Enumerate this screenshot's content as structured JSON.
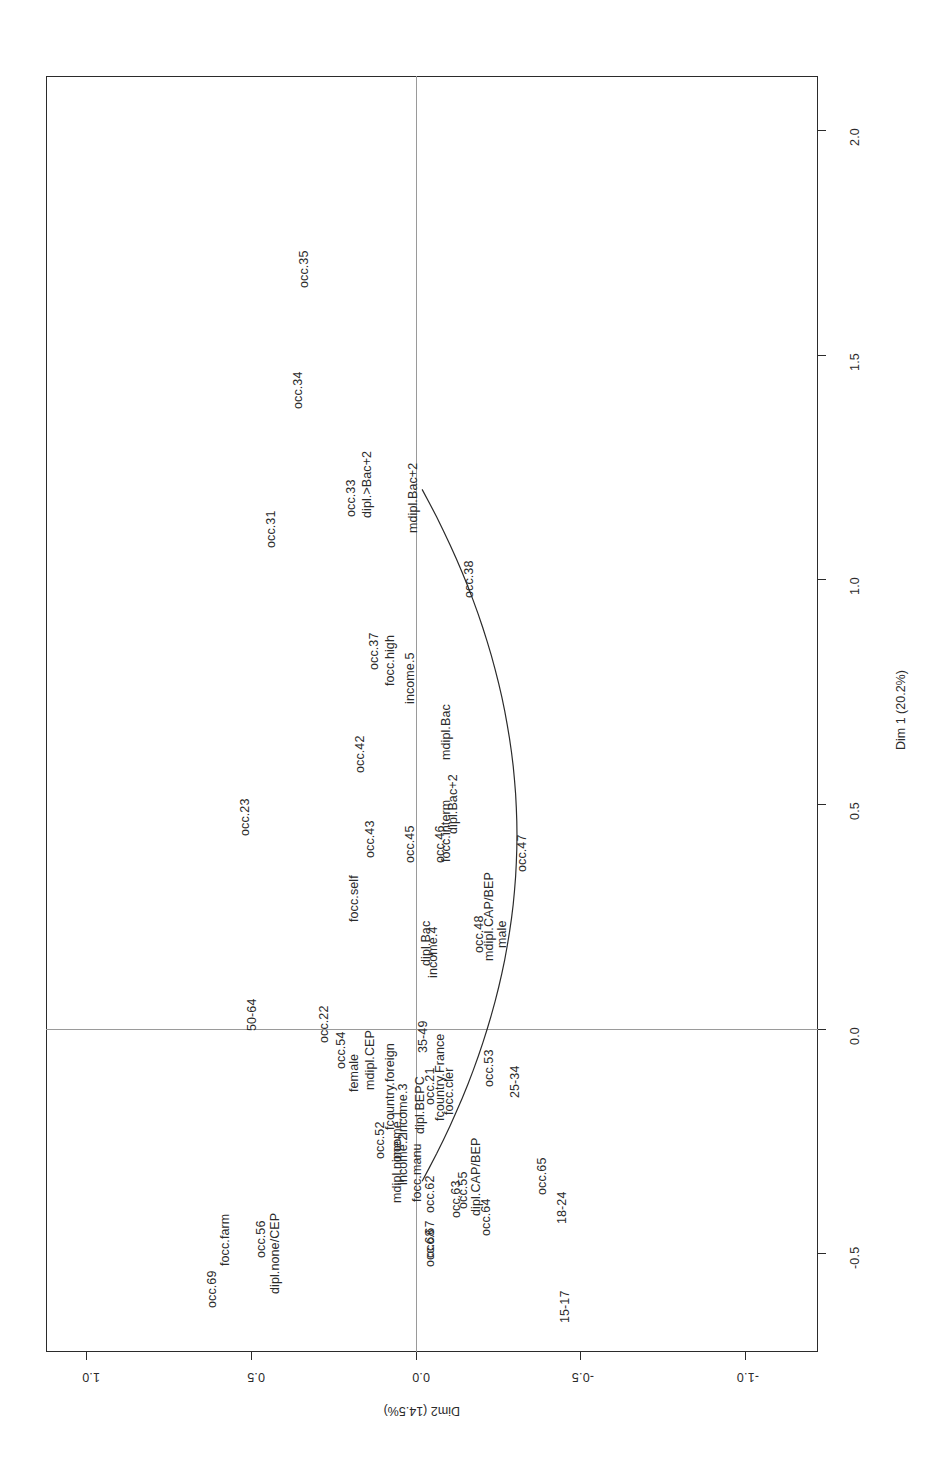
{
  "figure": {
    "orientation": "rotated-90",
    "background": "#ffffff",
    "frame_color": "#2b2b2b",
    "zero_line_color": "#9a9a9a",
    "text_color": "#2b2b2b"
  },
  "chart_data": {
    "type": "scatter",
    "title": "",
    "subtitle": "",
    "xlabel": "Dim 1 (20.2%)",
    "ylabel": "Dim2 (14.5%)",
    "xlim": [
      -0.72,
      2.12
    ],
    "ylim": [
      -1.22,
      1.12
    ],
    "xticks": [
      0.5,
      1.0,
      1.5,
      2.0
    ],
    "xticklabels": [
      "0.5",
      "1.0",
      "1.5",
      "2.0"
    ],
    "extra_xticks": [
      0.0,
      -0.5
    ],
    "extra_xticklabels": [
      "0.0",
      "-0.5"
    ],
    "yticks": [
      1.0,
      0.5,
      0.0,
      -0.5,
      -1.0
    ],
    "yticklabels": [
      "1.0",
      "0.5",
      "0.0",
      "-0.5",
      "-1.0"
    ],
    "grid": false,
    "legend": null,
    "zero_lines": [
      {
        "axis": "x",
        "value": 0.0
      },
      {
        "axis": "y",
        "value": 0.0
      }
    ],
    "annotations": [
      {
        "kind": "curve",
        "description": "horseshoe-arc"
      }
    ],
    "points": [
      {
        "label": "occ.69",
        "x": -0.58,
        "y": 0.62
      },
      {
        "label": "focc.farm",
        "x": -0.47,
        "y": 0.58
      },
      {
        "label": "dipl.none/CEP",
        "x": -0.5,
        "y": 0.43
      },
      {
        "label": "occ.56",
        "x": -0.47,
        "y": 0.47
      },
      {
        "label": "15-17",
        "x": -0.62,
        "y": -0.45
      },
      {
        "label": "18-24",
        "x": -0.4,
        "y": -0.44
      },
      {
        "label": "occ.65",
        "x": -0.33,
        "y": -0.38
      },
      {
        "label": "occ.64",
        "x": -0.42,
        "y": -0.21
      },
      {
        "label": "occ.63",
        "x": -0.38,
        "y": -0.12
      },
      {
        "label": "occ.62",
        "x": -0.37,
        "y": -0.04
      },
      {
        "label": "occ.67",
        "x": -0.47,
        "y": -0.04
      },
      {
        "label": "occ.68",
        "x": -0.49,
        "y": -0.04
      },
      {
        "label": "occ.55",
        "x": -0.36,
        "y": -0.14
      },
      {
        "label": "dipl.CAP/BEP",
        "x": -0.33,
        "y": -0.18
      },
      {
        "label": "focc.manu",
        "x": -0.32,
        "y": 0.0
      },
      {
        "label": "mdipl.none",
        "x": -0.32,
        "y": 0.06
      },
      {
        "label": "income.2",
        "x": -0.29,
        "y": 0.04
      },
      {
        "label": "income.1",
        "x": -0.24,
        "y": 0.06
      },
      {
        "label": "occ.52",
        "x": -0.25,
        "y": 0.11
      },
      {
        "label": "income.3",
        "x": -0.18,
        "y": 0.04
      },
      {
        "label": "dipl.BEPC",
        "x": -0.17,
        "y": -0.01
      },
      {
        "label": "occ.21",
        "x": -0.13,
        "y": -0.04
      },
      {
        "label": "fcountry.France",
        "x": -0.11,
        "y": -0.07
      },
      {
        "label": "focc.cler",
        "x": -0.14,
        "y": -0.1
      },
      {
        "label": "fcountry.foreign",
        "x": -0.13,
        "y": 0.08
      },
      {
        "label": "female",
        "x": -0.1,
        "y": 0.19
      },
      {
        "label": "occ.54",
        "x": -0.05,
        "y": 0.23
      },
      {
        "label": "mdipl.CEP",
        "x": -0.07,
        "y": 0.14
      },
      {
        "label": "occ.22",
        "x": 0.01,
        "y": 0.28
      },
      {
        "label": "50-64",
        "x": 0.03,
        "y": 0.5
      },
      {
        "label": "occ.23",
        "x": 0.47,
        "y": 0.52
      },
      {
        "label": "occ.31",
        "x": 1.11,
        "y": 0.44
      },
      {
        "label": "occ.34",
        "x": 1.42,
        "y": 0.36
      },
      {
        "label": "occ.35",
        "x": 1.69,
        "y": 0.34
      },
      {
        "label": "occ.33",
        "x": 1.18,
        "y": 0.2
      },
      {
        "label": "dipl.>Bac+2",
        "x": 1.21,
        "y": 0.15
      },
      {
        "label": "mdipl.Bac+2",
        "x": 1.18,
        "y": 0.01
      },
      {
        "label": "occ.37",
        "x": 0.84,
        "y": 0.13
      },
      {
        "label": "focc.high",
        "x": 0.82,
        "y": 0.08
      },
      {
        "label": "income.5",
        "x": 0.78,
        "y": 0.02
      },
      {
        "label": "occ.38",
        "x": 1.0,
        "y": -0.16
      },
      {
        "label": "occ.42",
        "x": 0.61,
        "y": 0.17
      },
      {
        "label": "mdipl.Bac",
        "x": 0.66,
        "y": -0.09
      },
      {
        "label": "dipl.Bac+2",
        "x": 0.5,
        "y": -0.11
      },
      {
        "label": "focc.interm",
        "x": 0.44,
        "y": -0.09
      },
      {
        "label": "occ.46",
        "x": 0.41,
        "y": -0.07
      },
      {
        "label": "occ.45",
        "x": 0.41,
        "y": 0.02
      },
      {
        "label": "occ.43",
        "x": 0.42,
        "y": 0.14
      },
      {
        "label": "focc.self",
        "x": 0.29,
        "y": 0.19
      },
      {
        "label": "dipl.Bac",
        "x": 0.19,
        "y": -0.03
      },
      {
        "label": "income.4",
        "x": 0.17,
        "y": -0.05
      },
      {
        "label": "occ.48",
        "x": 0.21,
        "y": -0.19
      },
      {
        "label": "mdipl.CAP/BEP",
        "x": 0.25,
        "y": -0.22
      },
      {
        "label": "male",
        "x": 0.21,
        "y": -0.26
      },
      {
        "label": "occ.47",
        "x": 0.39,
        "y": -0.32
      },
      {
        "label": "25-34",
        "x": -0.12,
        "y": -0.3
      },
      {
        "label": "occ.53",
        "x": -0.09,
        "y": -0.22
      },
      {
        "label": "35-49",
        "x": -0.02,
        "y": -0.02
      }
    ]
  }
}
